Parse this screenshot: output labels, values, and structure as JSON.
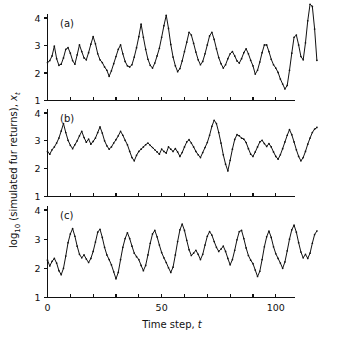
{
  "figure": {
    "background_color": "#ffffff",
    "line_color": "#111111",
    "ylabel": "log10 (simulated fur returns), xt",
    "ylabel_parts": {
      "log": "log",
      "subscript": "10",
      "middle": " (simulated fur returns), ",
      "variable": "x",
      "variable_subscript": "t"
    },
    "xlabel_parts": {
      "text": "Time step, ",
      "variable": "t"
    },
    "xlabel": "Time step, t"
  },
  "chart_data": [
    {
      "type": "line",
      "title": "(a)",
      "panel": "a",
      "xlabel": "Time step, t",
      "ylabel": "log10 (simulated fur returns), xt",
      "xlim": [
        0,
        120
      ],
      "ylim": [
        1,
        4.6
      ],
      "xticks": [
        0,
        10,
        20,
        30,
        40,
        50,
        60,
        70,
        80,
        90,
        100,
        110,
        120
      ],
      "xticklabels": [
        "0",
        "",
        "",
        "",
        "",
        "50",
        "",
        "",
        "",
        "",
        "100",
        "",
        ""
      ],
      "yticks": [
        1,
        2,
        3,
        4
      ],
      "yticklabels": [
        "1",
        "2",
        "3",
        "4"
      ],
      "grid": false,
      "legend": false,
      "markers": "dot",
      "x": [
        0,
        1,
        2,
        3,
        4,
        5,
        6,
        7,
        8,
        9,
        10,
        11,
        12,
        13,
        14,
        15,
        16,
        17,
        18,
        19,
        20,
        21,
        22,
        23,
        24,
        25,
        26,
        27,
        28,
        29,
        30,
        31,
        32,
        33,
        34,
        35,
        36,
        37,
        38,
        39,
        40,
        41,
        42,
        43,
        44,
        45,
        46,
        47,
        48,
        49,
        50,
        51,
        52,
        53,
        54,
        55,
        56,
        57,
        58,
        59,
        60,
        61,
        62,
        63,
        64,
        65,
        66,
        67,
        68,
        69,
        70,
        71,
        72,
        73,
        74,
        75,
        76,
        77,
        78,
        79,
        80,
        81,
        82,
        83,
        84,
        85,
        86,
        87,
        88,
        89,
        90,
        91,
        92,
        93,
        94,
        95,
        96,
        97,
        98,
        99,
        100,
        101,
        102,
        103,
        104,
        105,
        106,
        107,
        108,
        109,
        110,
        111,
        112,
        113,
        114,
        115,
        116,
        117,
        118
      ],
      "values": [
        2.38,
        2.45,
        2.62,
        2.98,
        2.52,
        2.28,
        2.32,
        2.55,
        2.86,
        2.92,
        2.72,
        2.45,
        2.32,
        2.66,
        3.02,
        2.78,
        2.55,
        2.48,
        2.74,
        3.05,
        3.32,
        3.06,
        2.7,
        2.48,
        2.38,
        2.22,
        2.1,
        1.88,
        2.08,
        2.34,
        2.6,
        2.86,
        3.02,
        2.7,
        2.42,
        2.26,
        2.22,
        2.3,
        2.58,
        2.92,
        3.32,
        3.78,
        3.3,
        2.86,
        2.5,
        2.28,
        2.18,
        2.36,
        2.62,
        2.9,
        3.3,
        3.72,
        4.1,
        3.62,
        3.04,
        2.58,
        2.26,
        2.05,
        2.16,
        2.44,
        2.78,
        3.12,
        3.48,
        3.38,
        3.08,
        2.76,
        2.48,
        2.3,
        2.42,
        2.7,
        3.02,
        3.35,
        3.48,
        3.22,
        2.88,
        2.56,
        2.34,
        2.18,
        2.3,
        2.52,
        2.7,
        2.78,
        2.62,
        2.44,
        2.36,
        2.52,
        2.74,
        2.88,
        2.7,
        2.46,
        2.26,
        1.96,
        2.1,
        2.4,
        2.74,
        3.02,
        3.02,
        2.78,
        2.5,
        2.3,
        2.18,
        2.02,
        1.78,
        1.6,
        1.42,
        1.55,
        2.1,
        2.72,
        3.3,
        3.38,
        3.02,
        2.6,
        2.48,
        3.1,
        3.9,
        4.5,
        4.42,
        3.6,
        2.46,
        1.78,
        1.32,
        1.5,
        2.0,
        2.32
      ]
    },
    {
      "type": "line",
      "title": "(b)",
      "panel": "b",
      "xlabel": "Time step, t",
      "ylabel": "log10 (simulated fur returns), xt",
      "xlim": [
        0,
        120
      ],
      "ylim": [
        1,
        4.1
      ],
      "xticks": [
        0,
        10,
        20,
        30,
        40,
        50,
        60,
        70,
        80,
        90,
        100,
        110,
        120
      ],
      "xticklabels": [
        "0",
        "",
        "",
        "",
        "",
        "50",
        "",
        "",
        "",
        "",
        "100",
        "",
        ""
      ],
      "yticks": [
        1,
        2,
        3,
        4
      ],
      "yticklabels": [
        "1",
        "2",
        "3",
        "4"
      ],
      "grid": false,
      "legend": false,
      "markers": "dot",
      "x": [
        0,
        1,
        2,
        3,
        4,
        5,
        6,
        7,
        8,
        9,
        10,
        11,
        12,
        13,
        14,
        15,
        16,
        17,
        18,
        19,
        20,
        21,
        22,
        23,
        24,
        25,
        26,
        27,
        28,
        29,
        30,
        31,
        32,
        33,
        34,
        35,
        36,
        37,
        38,
        39,
        40,
        41,
        42,
        43,
        44,
        45,
        46,
        47,
        48,
        49,
        50,
        51,
        52,
        53,
        54,
        55,
        56,
        57,
        58,
        59,
        60,
        61,
        62,
        63,
        64,
        65,
        66,
        67,
        68,
        69,
        70,
        71,
        72,
        73,
        74,
        75,
        76,
        77,
        78,
        79,
        80,
        81,
        82,
        83,
        84,
        85,
        86,
        87,
        88,
        89,
        90,
        91,
        92,
        93,
        94,
        95,
        96,
        97,
        98,
        99,
        100,
        101,
        102,
        103,
        104,
        105,
        106,
        107,
        108,
        109,
        110,
        111,
        112,
        113,
        114,
        115,
        116,
        117,
        118
      ],
      "values": [
        2.62,
        2.52,
        2.68,
        2.78,
        2.92,
        3.1,
        3.35,
        3.62,
        3.3,
        3.02,
        2.84,
        2.72,
        2.86,
        3.0,
        3.18,
        3.34,
        3.12,
        2.95,
        3.06,
        2.88,
        2.98,
        3.1,
        3.3,
        3.5,
        3.28,
        3.0,
        2.82,
        2.7,
        2.78,
        2.92,
        3.04,
        3.18,
        3.34,
        3.2,
        3.02,
        2.86,
        2.62,
        2.4,
        2.28,
        2.48,
        2.62,
        2.7,
        2.78,
        2.86,
        2.92,
        2.84,
        2.76,
        2.68,
        2.6,
        2.52,
        2.7,
        2.62,
        2.56,
        2.78,
        2.7,
        2.62,
        2.72,
        2.6,
        2.44,
        2.58,
        2.78,
        2.96,
        3.04,
        2.92,
        2.78,
        2.62,
        2.5,
        2.4,
        2.58,
        2.76,
        2.94,
        3.2,
        3.52,
        3.74,
        3.62,
        3.3,
        2.92,
        2.5,
        2.16,
        1.92,
        2.3,
        2.7,
        3.05,
        3.22,
        3.18,
        3.1,
        3.06,
        2.94,
        2.72,
        2.52,
        2.44,
        2.6,
        2.78,
        2.96,
        3.02,
        2.9,
        2.8,
        2.9,
        2.78,
        2.6,
        2.44,
        2.34,
        2.5,
        2.72,
        2.96,
        3.2,
        3.4,
        3.22,
        2.96,
        2.68,
        2.44,
        2.28,
        2.4,
        2.62,
        2.88,
        3.1,
        3.3,
        3.42,
        3.48
      ]
    },
    {
      "type": "line",
      "title": "(c)",
      "panel": "c",
      "xlabel": "Time step, t",
      "ylabel": "log10 (simulated fur returns), xt",
      "xlim": [
        0,
        120
      ],
      "ylim": [
        1,
        4.1
      ],
      "xticks": [
        0,
        10,
        20,
        30,
        40,
        50,
        60,
        70,
        80,
        90,
        100,
        110,
        120
      ],
      "xticklabels": [
        "0",
        "",
        "",
        "",
        "",
        "50",
        "",
        "",
        "",
        "",
        "100",
        "",
        ""
      ],
      "yticks": [
        1,
        2,
        3,
        4
      ],
      "yticklabels": [
        "1",
        "2",
        "3",
        "4"
      ],
      "grid": false,
      "legend": false,
      "markers": "dot",
      "x": [
        0,
        1,
        2,
        3,
        4,
        5,
        6,
        7,
        8,
        9,
        10,
        11,
        12,
        13,
        14,
        15,
        16,
        17,
        18,
        19,
        20,
        21,
        22,
        23,
        24,
        25,
        26,
        27,
        28,
        29,
        30,
        31,
        32,
        33,
        34,
        35,
        36,
        37,
        38,
        39,
        40,
        41,
        42,
        43,
        44,
        45,
        46,
        47,
        48,
        49,
        50,
        51,
        52,
        53,
        54,
        55,
        56,
        57,
        58,
        59,
        60,
        61,
        62,
        63,
        64,
        65,
        66,
        67,
        68,
        69,
        70,
        71,
        72,
        73,
        74,
        75,
        76,
        77,
        78,
        79,
        80,
        81,
        82,
        83,
        84,
        85,
        86,
        87,
        88,
        89,
        90,
        91,
        92,
        93,
        94,
        95,
        96,
        97,
        98,
        99,
        100,
        101,
        102,
        103,
        104,
        105,
        106,
        107,
        108,
        109,
        110,
        111,
        112,
        113,
        114,
        115,
        116,
        117,
        118
      ],
      "values": [
        2.28,
        2.08,
        2.24,
        2.34,
        2.18,
        1.92,
        1.78,
        2.0,
        2.42,
        2.88,
        3.18,
        3.36,
        3.1,
        2.76,
        2.48,
        2.36,
        2.46,
        2.32,
        2.2,
        2.34,
        2.58,
        2.9,
        3.24,
        3.34,
        3.06,
        2.72,
        2.46,
        2.3,
        2.12,
        1.88,
        1.64,
        1.86,
        2.3,
        2.72,
        3.02,
        3.22,
        3.02,
        2.76,
        2.52,
        2.4,
        2.3,
        2.1,
        1.92,
        2.1,
        2.46,
        2.86,
        3.18,
        3.3,
        3.08,
        2.8,
        2.54,
        2.36,
        2.2,
        2.02,
        1.86,
        2.04,
        2.46,
        2.92,
        3.32,
        3.52,
        3.3,
        2.96,
        2.64,
        2.44,
        2.52,
        2.62,
        2.48,
        2.3,
        2.48,
        2.8,
        3.1,
        3.26,
        3.14,
        2.92,
        2.72,
        2.58,
        2.66,
        2.76,
        2.58,
        2.34,
        2.12,
        2.3,
        2.62,
        2.98,
        3.26,
        3.3,
        3.02,
        2.7,
        2.44,
        2.28,
        2.16,
        1.94,
        1.72,
        1.9,
        2.3,
        2.74,
        3.08,
        3.28,
        3.06,
        2.74,
        2.5,
        2.34,
        2.18,
        2.0,
        2.22,
        2.6,
        3.0,
        3.32,
        3.48,
        3.24,
        2.88,
        2.56,
        2.36,
        2.48,
        2.34,
        2.52,
        2.86,
        3.16,
        3.28
      ]
    }
  ]
}
